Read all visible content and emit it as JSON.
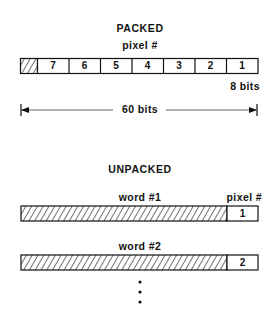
{
  "packed": {
    "title": "PACKED",
    "pixel_label": "pixel #",
    "cells": [
      "7",
      "6",
      "5",
      "4",
      "3",
      "2",
      "1"
    ],
    "cell_size_label": "8 bits",
    "total_width_label": "60 bits",
    "leading_cell": "hatched unused bits"
  },
  "unpacked": {
    "title": "UNPACKED",
    "pixel_label": "pixel #",
    "words": [
      {
        "label": "word #1",
        "pixel": "1"
      },
      {
        "label": "word #2",
        "pixel": "2"
      }
    ],
    "continuation": "⋮"
  },
  "colors": {
    "ink": "#111111",
    "background": "#ffffff"
  }
}
